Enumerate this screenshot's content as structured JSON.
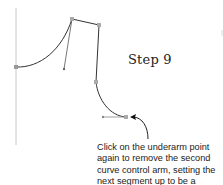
{
  "diagram": {
    "step_title": "Step 9",
    "caption_lines": [
      "Click on the underarm point",
      "again to remove the second",
      "curve control arm, setting the",
      "next segment up to be a"
    ],
    "colors": {
      "stroke": "#333333",
      "guide": "#bbbbbb",
      "handle": "#999999",
      "anchor": "#aaaaaa"
    },
    "points": {
      "left_anchor": [
        16,
        67
      ],
      "shoulder_neck": [
        72,
        19
      ],
      "shoulder_tip": [
        99,
        25
      ],
      "shoulder_control_end": [
        64,
        69
      ],
      "armhole_mid": [
        96,
        82
      ],
      "underarm": [
        126,
        117
      ],
      "underarm_control_end": [
        103,
        117
      ]
    }
  }
}
